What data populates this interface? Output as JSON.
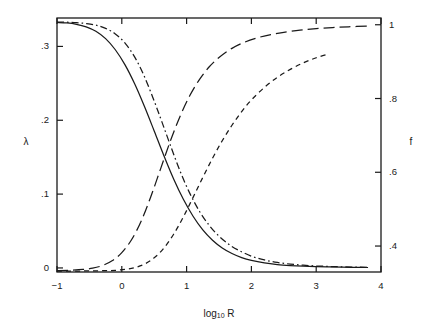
{
  "figure": {
    "background": "#ffffff",
    "frame_color": "#1a1a1a",
    "line_color": "#1a1a1a"
  },
  "axes": {
    "x": {
      "label_prefix": "log",
      "label_subscript": "10",
      "label_suffix": " R",
      "label_full": "log10 R",
      "ticks": [
        "−1",
        "0",
        "1",
        "2",
        "3",
        "4"
      ],
      "values": [
        -1,
        0,
        1,
        2,
        3,
        4
      ],
      "range": [
        -1,
        4
      ]
    },
    "y_left": {
      "label": "λ",
      "ticks": [
        "0",
        ".1",
        ".2",
        ".3"
      ],
      "values": [
        0,
        0.1,
        0.2,
        0.3
      ],
      "range": [
        -0.0055,
        0.3385
      ]
    },
    "y_right": {
      "label": "f",
      "ticks": [
        ".4",
        ".6",
        ".8",
        "1"
      ],
      "values": [
        0.4,
        0.6,
        0.8,
        1.0
      ],
      "range": [
        0.3296,
        1.0183
      ]
    }
  },
  "chart_data": {
    "type": "line",
    "title": "",
    "xlabel": "log10 R",
    "ylabel": "λ",
    "ylabel_secondary": "f",
    "xlim": [
      -1,
      4
    ],
    "ylim": [
      -0.0055,
      0.3385
    ],
    "ylim_secondary": [
      0.3296,
      1.0183
    ],
    "grid": false,
    "legend": "none",
    "series": [
      {
        "name": "lambda-solid",
        "axis": "left",
        "style": "solid",
        "x": [
          -1.0,
          -0.85,
          -0.7,
          -0.55,
          -0.4,
          -0.25,
          -0.1,
          0.05,
          0.2,
          0.35,
          0.5,
          0.65,
          0.8,
          0.95,
          1.1,
          1.25,
          1.4,
          1.55,
          1.7,
          1.85,
          2.0,
          2.2,
          2.4,
          2.6,
          2.8,
          3.0,
          3.2,
          3.4,
          3.6,
          3.8
        ],
        "y": [
          0.3325,
          0.3318,
          0.33,
          0.3265,
          0.3205,
          0.3105,
          0.2955,
          0.275,
          0.249,
          0.2185,
          0.1855,
          0.152,
          0.1205,
          0.093,
          0.07,
          0.0515,
          0.0375,
          0.027,
          0.0195,
          0.014,
          0.0102,
          0.0068,
          0.0046,
          0.0032,
          0.0023,
          0.0017,
          0.0013,
          0.001,
          0.0008,
          0.0006
        ]
      },
      {
        "name": "lambda-dashdot",
        "axis": "left",
        "style": "dashdot",
        "x": [
          -1.0,
          -0.85,
          -0.7,
          -0.55,
          -0.4,
          -0.25,
          -0.1,
          0.05,
          0.2,
          0.35,
          0.5,
          0.62,
          0.75,
          0.9,
          1.05,
          1.2,
          1.35,
          1.5,
          1.65,
          1.8,
          2.0,
          2.2,
          2.4,
          2.6,
          2.8,
          3.0,
          3.2,
          3.4,
          3.6,
          3.8
        ],
        "y": [
          0.333,
          0.3328,
          0.3322,
          0.331,
          0.3288,
          0.3245,
          0.317,
          0.3045,
          0.2855,
          0.259,
          0.226,
          0.1975,
          0.166,
          0.131,
          0.101,
          0.0765,
          0.0575,
          0.043,
          0.032,
          0.024,
          0.016,
          0.0108,
          0.0074,
          0.0052,
          0.0037,
          0.0027,
          0.002,
          0.0015,
          0.0011,
          0.0008
        ]
      },
      {
        "name": "f-longdash",
        "axis": "right",
        "style": "longdash",
        "x": [
          -1.0,
          -0.8,
          -0.6,
          -0.45,
          -0.3,
          -0.15,
          0.0,
          0.15,
          0.3,
          0.45,
          0.6,
          0.75,
          0.9,
          1.05,
          1.2,
          1.35,
          1.5,
          1.7,
          1.9,
          2.1,
          2.3,
          2.5,
          2.75,
          3.0,
          3.25,
          3.5,
          3.8
        ],
        "y": [
          0.3335,
          0.3345,
          0.3365,
          0.34,
          0.347,
          0.36,
          0.382,
          0.417,
          0.468,
          0.535,
          0.61,
          0.685,
          0.752,
          0.808,
          0.852,
          0.886,
          0.911,
          0.936,
          0.953,
          0.965,
          0.9735,
          0.9795,
          0.9855,
          0.9895,
          0.9925,
          0.9945,
          0.9965
        ]
      },
      {
        "name": "f-shortdash",
        "axis": "right",
        "style": "shortdash",
        "x": [
          -1.0,
          -0.7,
          -0.45,
          -0.25,
          -0.1,
          0.05,
          0.2,
          0.35,
          0.5,
          0.65,
          0.8,
          0.95,
          1.1,
          1.25,
          1.4,
          1.55,
          1.7,
          1.85,
          2.0,
          2.2,
          2.4,
          2.6,
          2.8,
          3.0,
          3.2
        ],
        "y": [
          0.332,
          0.3322,
          0.3326,
          0.3332,
          0.3342,
          0.3365,
          0.3415,
          0.351,
          0.368,
          0.3945,
          0.432,
          0.479,
          0.532,
          0.586,
          0.638,
          0.6855,
          0.7275,
          0.7645,
          0.796,
          0.83,
          0.8575,
          0.879,
          0.8965,
          0.9105,
          0.9215
        ]
      }
    ]
  }
}
